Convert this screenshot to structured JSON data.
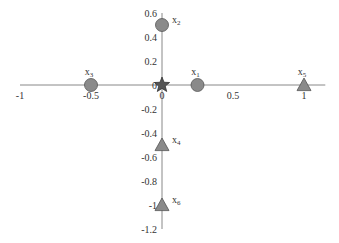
{
  "chart_data": {
    "type": "scatter",
    "title": "",
    "xlabel": "",
    "ylabel": "",
    "xlim": [
      -1,
      1.15
    ],
    "ylim": [
      -1.2,
      0.6
    ],
    "grid": false,
    "legend": null,
    "x_ticks": [
      {
        "value": -1,
        "label": "-1"
      },
      {
        "value": -0.5,
        "label": "-0.5"
      },
      {
        "value": 0,
        "label": "0"
      },
      {
        "value": 0.5,
        "label": "0.5"
      },
      {
        "value": 1,
        "label": "1"
      }
    ],
    "y_ticks": [
      {
        "value": 0.6,
        "label": "0.6"
      },
      {
        "value": 0.4,
        "label": "0.4"
      },
      {
        "value": 0.2,
        "label": "0.2"
      },
      {
        "value": 0,
        "label": "0"
      },
      {
        "value": -0.2,
        "label": "-0.2"
      },
      {
        "value": -0.4,
        "label": "-0.4"
      },
      {
        "value": -0.6,
        "label": "-0.6"
      },
      {
        "value": -0.8,
        "label": "-0.8"
      },
      {
        "value": -1,
        "label": "-1"
      },
      {
        "value": -1.2,
        "label": "-1.2"
      }
    ],
    "points": [
      {
        "name": "x",
        "sub": "1",
        "x": 0.25,
        "y": 0,
        "marker": "circle",
        "label_pos": "above"
      },
      {
        "name": "x",
        "sub": "2",
        "x": 0,
        "y": 0.5,
        "marker": "circle",
        "label_pos": "right"
      },
      {
        "name": "x",
        "sub": "3",
        "x": -0.5,
        "y": 0,
        "marker": "circle",
        "label_pos": "above"
      },
      {
        "name": "x",
        "sub": "4",
        "x": 0,
        "y": -0.5,
        "marker": "triangle",
        "label_pos": "right"
      },
      {
        "name": "x",
        "sub": "5",
        "x": 1,
        "y": 0,
        "marker": "triangle",
        "label_pos": "above"
      },
      {
        "name": "x",
        "sub": "6",
        "x": 0,
        "y": -1,
        "marker": "triangle",
        "label_pos": "right"
      }
    ],
    "origin_marker": {
      "x": 0,
      "y": 0,
      "marker": "star"
    },
    "colors": {
      "axis": "#888888",
      "marker_fill": "#8a8a8a",
      "marker_stroke": "#555555",
      "star_fill": "#555555",
      "star_stroke": "#333333",
      "text": "#333333"
    }
  }
}
